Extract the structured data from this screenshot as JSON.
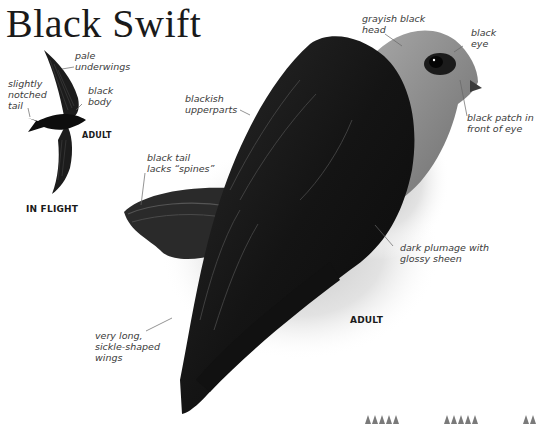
{
  "page": {
    "title": "Black Swift"
  },
  "in_flight": {
    "caption": "IN FLIGHT",
    "adult_caption": "ADULT",
    "labels": {
      "pale_underwings": "pale\nunderwings",
      "notched_tail": "slightly\nnotched\ntail",
      "black_body": "black\nbody"
    }
  },
  "perched": {
    "adult_caption": "ADULT",
    "labels": {
      "head": "grayish black\nhead",
      "eye": "black\neye",
      "eye_patch": "black patch in\nfront of eye",
      "upperparts": "blackish\nupperparts",
      "tail": "black tail\nlacks “spines”",
      "plumage": "dark plumage with\nglossy sheen",
      "wings": "very long,\nsickle-shaped\nwings"
    }
  },
  "footer": {
    "tooth_groups": [
      5,
      5,
      2
    ]
  },
  "colors": {
    "text": "#3a3a3a",
    "title": "#1a1a1a",
    "bird_dark": "#141414",
    "head_gray": "#8a8a8a",
    "background_wash": "#d9d9d9"
  }
}
